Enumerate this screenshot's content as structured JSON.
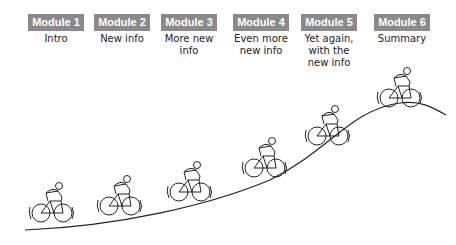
{
  "modules": [
    {
      "label": "Module 1",
      "desc": "Intro",
      "x": 25
    },
    {
      "label": "Module 2",
      "desc": "New info",
      "x": 91
    },
    {
      "label": "Module 3",
      "desc": "More new info",
      "x": 160
    },
    {
      "label": "Module 4",
      "desc": "Even more new info",
      "x": 230
    },
    {
      "label": "Module 5",
      "desc": "Yet again, with the new info",
      "x": 300
    },
    {
      "label": "Module 6",
      "desc": "Summary",
      "x": 372
    }
  ],
  "colors": {
    "badge": "#8a8a8a",
    "line": "#222222"
  },
  "cyclists": [
    {
      "x": 47,
      "y": 210
    },
    {
      "x": 116,
      "y": 203
    },
    {
      "x": 185,
      "y": 188
    },
    {
      "x": 262,
      "y": 166
    },
    {
      "x": 325,
      "y": 126
    },
    {
      "x": 392,
      "y": 105
    }
  ]
}
